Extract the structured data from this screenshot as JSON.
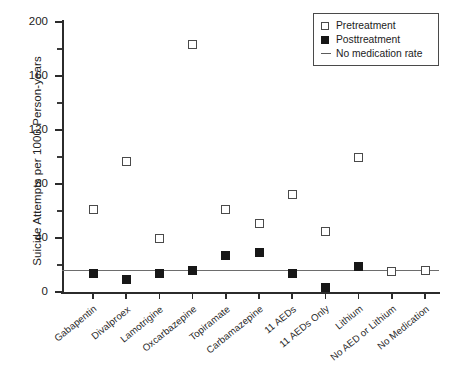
{
  "chart_data": {
    "type": "scatter",
    "title": "",
    "xlabel": "",
    "ylabel": "Suicide Attempts per 1000 Person-years",
    "ylim": [
      0,
      200
    ],
    "ytick_values": [
      0,
      40,
      80,
      120,
      160,
      200
    ],
    "ytick_labels": [
      "0",
      "40",
      "80",
      "120",
      "160",
      "200"
    ],
    "yminor_values": [
      20,
      60,
      100,
      140,
      180
    ],
    "grid": false,
    "legend_position": "top-right",
    "categories": [
      "Gabapentin",
      "Divalproex",
      "Lamotrigine",
      "Oxcarbazepine",
      "Topiramate",
      "Carbamazepine",
      "11 AEDs",
      "11 AEDs Only",
      "Lithium",
      "No AED or Lithium",
      "No Medication"
    ],
    "series": [
      {
        "name": "Pretreatment",
        "marker": "open-square",
        "color": "#ffffff",
        "edge_color": "#4a4a4a",
        "values": [
          61,
          97,
          40,
          183,
          61,
          51,
          72,
          45,
          100,
          15,
          16
        ]
      },
      {
        "name": "Posttreatment",
        "marker": "filled-square",
        "color": "#171717",
        "values": [
          14,
          9,
          14,
          16,
          27,
          29,
          14,
          3,
          19,
          null,
          null
        ]
      }
    ],
    "reference_line": {
      "name": "No medication rate",
      "value": 16,
      "color": "#6d6d6d"
    },
    "legend": [
      {
        "label": "Pretreatment",
        "key": "open-square"
      },
      {
        "label": "Posttreatment",
        "key": "filled-square"
      },
      {
        "label": "No medication rate",
        "key": "line"
      }
    ]
  }
}
